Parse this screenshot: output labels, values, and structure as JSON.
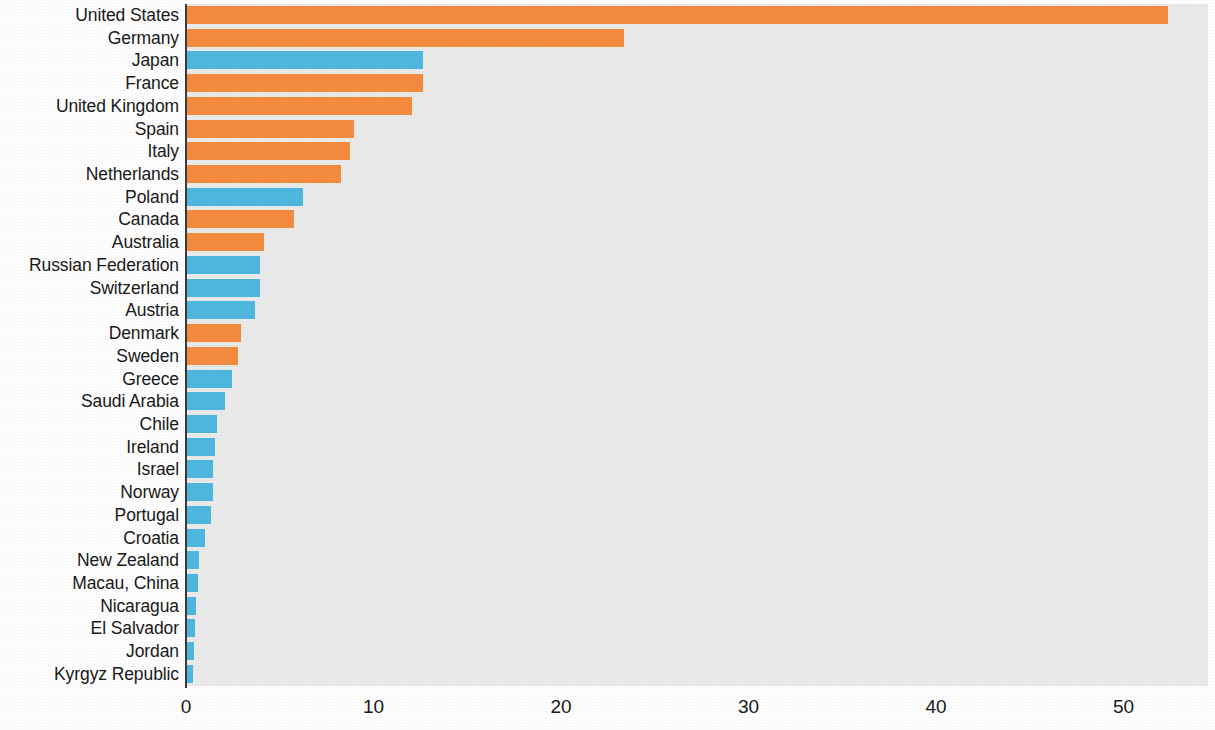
{
  "chart_data": {
    "type": "bar",
    "orientation": "horizontal",
    "title": "",
    "subtitle": "",
    "xlabel": "",
    "ylabel": "",
    "xlim": [
      0,
      54.5
    ],
    "xticks": [
      0,
      10,
      20,
      30,
      40,
      50
    ],
    "xtick_labels": [
      "0",
      "10",
      "20",
      "30",
      "40",
      "50"
    ],
    "grid": false,
    "legend": null,
    "colors": {
      "orange": "#f68c3f",
      "blue": "#4fb8e0",
      "plot_background": "#ebebeb",
      "axis_line": "#3b3b3b",
      "text": "#1a1a1a"
    },
    "categories": [
      "United States",
      "Germany",
      "Japan",
      "France",
      "United Kingdom",
      "Spain",
      "Italy",
      "Netherlands",
      "Poland",
      "Canada",
      "Australia",
      "Russian Federation",
      "Switzerland",
      "Austria",
      "Denmark",
      "Sweden",
      "Greece",
      "Saudi Arabia",
      "Chile",
      "Ireland",
      "Israel",
      "Norway",
      "Portugal",
      "Croatia",
      "New Zealand",
      "Macau, China",
      "Nicaragua",
      "El Salvador",
      "Jordan",
      "Kyrgyz Republic"
    ],
    "values": [
      52.3,
      23.3,
      12.6,
      12.6,
      12.0,
      8.9,
      8.7,
      8.2,
      6.2,
      5.7,
      4.1,
      3.9,
      3.9,
      3.6,
      2.9,
      2.7,
      2.4,
      2.0,
      1.6,
      1.5,
      1.4,
      1.4,
      1.3,
      0.95,
      0.65,
      0.6,
      0.5,
      0.45,
      0.35,
      0.3
    ],
    "bar_colors": [
      "orange",
      "orange",
      "blue",
      "orange",
      "orange",
      "orange",
      "orange",
      "orange",
      "blue",
      "orange",
      "orange",
      "blue",
      "blue",
      "blue",
      "orange",
      "orange",
      "blue",
      "blue",
      "blue",
      "blue",
      "blue",
      "blue",
      "blue",
      "blue",
      "blue",
      "blue",
      "blue",
      "blue",
      "blue",
      "blue"
    ]
  }
}
